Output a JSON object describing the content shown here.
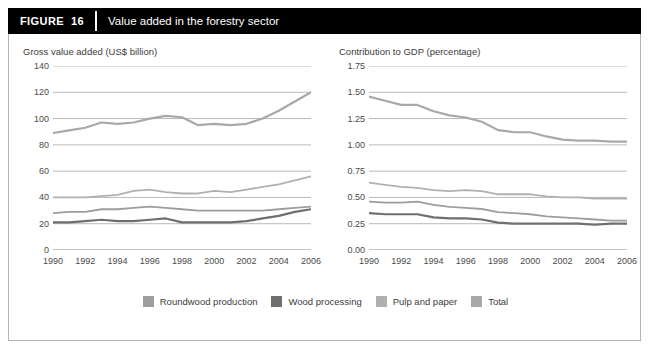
{
  "header": {
    "tag_label": "FIGURE",
    "figure_number": "16",
    "title": "Value added in the forestry sector"
  },
  "colors": {
    "header_bg": "#000000",
    "header_text": "#ffffff",
    "panel_border": "#b4b4b4",
    "gridline": "#9a9a9a",
    "axis": "#808080",
    "tick_text": "#4a4a4a",
    "roundwood": "#9d9d9d",
    "wood_processing": "#6e6e6e",
    "pulp_paper": "#b0b0b0",
    "total": "#a8a8a8"
  },
  "legend": {
    "items": [
      {
        "label": "Roundwood production",
        "color": "#9d9d9d",
        "swatch": "legend-swatch-roundwood"
      },
      {
        "label": "Wood processing",
        "color": "#6e6e6e",
        "swatch": "legend-swatch-wood-processing"
      },
      {
        "label": "Pulp and paper",
        "color": "#b0b0b0",
        "swatch": "legend-swatch-pulp-paper"
      },
      {
        "label": "Total",
        "color": "#a8a8a8",
        "swatch": "legend-swatch-total"
      }
    ]
  },
  "chart_data": [
    {
      "id": "gross-value-added",
      "type": "line",
      "title": "Gross value added (US$ billion)",
      "xlabel": "",
      "ylabel": "Gross value added (US$ billion)",
      "x": [
        1990,
        1991,
        1992,
        1993,
        1994,
        1995,
        1996,
        1997,
        1998,
        1999,
        2000,
        2001,
        2002,
        2003,
        2004,
        2005,
        2006
      ],
      "xlim": [
        1990,
        2006
      ],
      "ylim": [
        0,
        140
      ],
      "yticks": [
        0,
        20,
        40,
        60,
        80,
        100,
        120,
        140
      ],
      "ytick_labels": [
        "0",
        "20",
        "40",
        "60",
        "80",
        "100",
        "120",
        "140"
      ],
      "xticks": [
        1990,
        1991,
        1992,
        1993,
        1994,
        1995,
        1996,
        1997,
        1998,
        1999,
        2000,
        2001,
        2002,
        2003,
        2004,
        2005,
        2006
      ],
      "xtick_labels": [
        "1990",
        "",
        "1992",
        "",
        "1994",
        "",
        "1996",
        "",
        "1998",
        "",
        "2000",
        "",
        "2002",
        "",
        "2004",
        "",
        "2006"
      ],
      "grid": true,
      "legend_position": "bottom",
      "series": [
        {
          "name": "Total",
          "color": "#a8a8a8",
          "width": 2.2,
          "values": [
            89,
            91,
            93,
            97,
            96,
            97,
            100,
            102,
            101,
            95,
            96,
            95,
            96,
            100,
            106,
            113,
            120
          ]
        },
        {
          "name": "Pulp and paper",
          "color": "#b0b0b0",
          "width": 1.8,
          "values": [
            40,
            40,
            40,
            41,
            42,
            45,
            46,
            44,
            43,
            43,
            45,
            44,
            46,
            48,
            50,
            53,
            56
          ]
        },
        {
          "name": "Roundwood production",
          "color": "#9d9d9d",
          "width": 1.8,
          "values": [
            28,
            29,
            29,
            31,
            31,
            32,
            33,
            32,
            31,
            30,
            30,
            30,
            30,
            30,
            31,
            32,
            33
          ]
        },
        {
          "name": "Wood processing",
          "color": "#6e6e6e",
          "width": 2.2,
          "values": [
            21,
            21,
            22,
            23,
            22,
            22,
            23,
            24,
            21,
            21,
            21,
            21,
            22,
            24,
            26,
            29,
            31
          ]
        }
      ]
    },
    {
      "id": "contribution-to-gdp",
      "type": "line",
      "title": "Contribution to GDP (percentage)",
      "xlabel": "",
      "ylabel": "Contribution to GDP (percentage)",
      "x": [
        1990,
        1991,
        1992,
        1993,
        1994,
        1995,
        1996,
        1997,
        1998,
        1999,
        2000,
        2001,
        2002,
        2003,
        2004,
        2005,
        2006
      ],
      "xlim": [
        1990,
        2006
      ],
      "ylim": [
        0,
        1.75
      ],
      "yticks": [
        0,
        0.25,
        0.5,
        0.75,
        1.0,
        1.25,
        1.5,
        1.75
      ],
      "ytick_labels": [
        "0.00",
        "0.25",
        "0.50",
        "0.75",
        "1.00",
        "1.25",
        "1.50",
        "1.75"
      ],
      "xticks": [
        1990,
        1991,
        1992,
        1993,
        1994,
        1995,
        1996,
        1997,
        1998,
        1999,
        2000,
        2001,
        2002,
        2003,
        2004,
        2005,
        2006
      ],
      "xtick_labels": [
        "1990",
        "",
        "1992",
        "",
        "1994",
        "",
        "1996",
        "",
        "1998",
        "",
        "2000",
        "",
        "2002",
        "",
        "2004",
        "",
        "2006"
      ],
      "grid": true,
      "legend_position": "bottom",
      "series": [
        {
          "name": "Total",
          "color": "#a8a8a8",
          "width": 2.2,
          "values": [
            1.46,
            1.42,
            1.38,
            1.38,
            1.32,
            1.28,
            1.26,
            1.22,
            1.14,
            1.12,
            1.12,
            1.08,
            1.05,
            1.04,
            1.04,
            1.03,
            1.03
          ]
        },
        {
          "name": "Pulp and paper",
          "color": "#b0b0b0",
          "width": 1.8,
          "values": [
            0.64,
            0.62,
            0.6,
            0.59,
            0.57,
            0.56,
            0.57,
            0.56,
            0.53,
            0.53,
            0.53,
            0.51,
            0.5,
            0.5,
            0.49,
            0.49,
            0.49
          ]
        },
        {
          "name": "Roundwood production",
          "color": "#9d9d9d",
          "width": 1.8,
          "values": [
            0.46,
            0.45,
            0.45,
            0.46,
            0.43,
            0.41,
            0.4,
            0.39,
            0.36,
            0.35,
            0.34,
            0.32,
            0.31,
            0.3,
            0.29,
            0.28,
            0.28
          ]
        },
        {
          "name": "Wood processing",
          "color": "#6e6e6e",
          "width": 2.2,
          "values": [
            0.35,
            0.34,
            0.34,
            0.34,
            0.31,
            0.3,
            0.3,
            0.29,
            0.26,
            0.25,
            0.25,
            0.25,
            0.25,
            0.25,
            0.24,
            0.25,
            0.25
          ]
        }
      ]
    }
  ]
}
